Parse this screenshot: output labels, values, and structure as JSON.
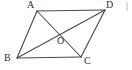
{
  "figure": {
    "background_color": "#ffffff",
    "stroke_color": "#4a4a4a",
    "label_color": "#2e2e2e",
    "width": 132,
    "height": 70
  },
  "labels": {
    "a": "A",
    "b": "B",
    "c": "C",
    "d": "D",
    "o": "O"
  },
  "points": {
    "A": {
      "x": 37,
      "y": 11
    },
    "B": {
      "x": 17,
      "y": 58
    },
    "C": {
      "x": 81,
      "y": 57
    },
    "D": {
      "x": 105,
      "y": 10
    },
    "O": {
      "x": 60,
      "y": 34
    }
  },
  "segments": [
    {
      "name": "side-AD",
      "from": "A",
      "to": "D"
    },
    {
      "name": "side-AB",
      "from": "A",
      "to": "B"
    },
    {
      "name": "side-BC",
      "from": "B",
      "to": "C"
    },
    {
      "name": "side-DC",
      "from": "D",
      "to": "C"
    },
    {
      "name": "diagonal-AC",
      "from": "A",
      "to": "C"
    },
    {
      "name": "diagonal-BD",
      "from": "B",
      "to": "D"
    }
  ]
}
